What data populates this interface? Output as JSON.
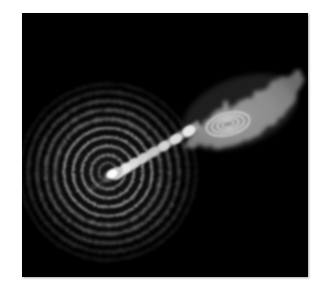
{
  "figure": {
    "title": "",
    "panel_background": "#000000",
    "page_background": "#ffffff",
    "width_px": 328,
    "height_px": 297,
    "panel": {
      "x": 22,
      "y": 13,
      "width": 286,
      "height": 264
    }
  },
  "chart_data": {
    "type": "heatmap",
    "title": "",
    "subtitle": "",
    "xlabel": "",
    "ylabel": "",
    "grid": false,
    "legend": "none",
    "colormap": "grayscale",
    "value_range": [
      0,
      1
    ],
    "features": [
      {
        "name": "ripple-rings",
        "kind": "concentric-rings",
        "center_px": [
          108,
          172
        ],
        "ring_count": 10,
        "ring_spacing_px": 8.5,
        "outer_radius_px": 86,
        "peak_gray": "#8e8e8e",
        "trough_gray": "#050505"
      },
      {
        "name": "core",
        "kind": "point-source",
        "center_px": [
          112,
          172
        ],
        "radius_px": 7,
        "peak_gray": "#f2f2f2"
      },
      {
        "name": "jet",
        "kind": "collimated-beam",
        "start_px": [
          112,
          172
        ],
        "end_px": [
          196,
          122
        ],
        "position_angle_deg": 31,
        "knot_count": 8,
        "peak_gray": "#efefef",
        "knots_px": [
          [
            119,
            168
          ],
          [
            128,
            163
          ],
          [
            137,
            158
          ],
          [
            146,
            153
          ],
          [
            156,
            147
          ],
          [
            166,
            141
          ],
          [
            177,
            134
          ],
          [
            189,
            127
          ]
        ]
      },
      {
        "name": "lobe",
        "kind": "extended-emission",
        "centroid_px": [
          232,
          106
        ],
        "extent_px": [
          110,
          70
        ],
        "mean_gray": "#9c9c9c"
      },
      {
        "name": "lobe-contours",
        "kind": "nested-ellipses",
        "center_px": [
          228,
          124
        ],
        "contour_count": 4,
        "major_axis_px": [
          44,
          33,
          22,
          12
        ],
        "minor_axis_px": [
          22,
          16,
          11,
          6
        ],
        "rotation_deg": -14,
        "stroke_gray": "#e2e2e2"
      }
    ]
  },
  "accessibility": {
    "alt_text": "Grayscale astronomical image of concentric ripples, a knotty jet, and a bright lobe with nested contours on a black background."
  }
}
